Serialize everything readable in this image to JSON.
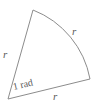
{
  "figure": {
    "name": "circular-sector-one-radian",
    "type": "geometry-diagram",
    "background_color": "#ffffff",
    "stroke_color": "#8c8c8c",
    "label_color": "#5a5a5a",
    "stroke_width": 1,
    "geometry": {
      "center_vertex": {
        "x": 8,
        "y": 99
      },
      "top_vertex": {
        "x": 33,
        "y": 10
      },
      "right_vertex": {
        "x": 90,
        "y": 79
      },
      "arc_radius": 92,
      "arc_sweep_flag": 1,
      "arc_large_flag": 0,
      "central_angle_radians": 1
    },
    "labels": {
      "radius_left": "r",
      "radius_arc": "r",
      "radius_bottom": "r",
      "central_angle": "1 rad"
    }
  }
}
